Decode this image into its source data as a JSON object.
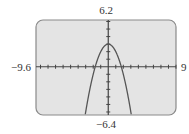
{
  "chart_data": {
    "type": "line",
    "title": "",
    "xlabel": "",
    "ylabel": "",
    "xlim": [
      -9.6,
      9
    ],
    "ylim": [
      -6.4,
      6.2
    ],
    "xscale": 1,
    "yscale": 1,
    "grid": false,
    "legend": null,
    "window_labels": {
      "xmin": "−9.6",
      "xmax": "9",
      "ymax": "6.2",
      "ymin": "−6.4"
    },
    "series": [
      {
        "name": "y = 3 − x²",
        "function": "3 - x^2",
        "vertex": [
          0,
          3
        ],
        "x_intercepts": [
          -1.73,
          1.73
        ],
        "points": [
          [
            -3.07,
            -6.4
          ],
          [
            -3,
            -6
          ],
          [
            -2.5,
            -3.25
          ],
          [
            -2,
            -1
          ],
          [
            -1.5,
            0.75
          ],
          [
            -1,
            2
          ],
          [
            -0.5,
            2.75
          ],
          [
            0,
            3
          ],
          [
            0.5,
            2.75
          ],
          [
            1,
            2
          ],
          [
            1.5,
            0.75
          ],
          [
            2,
            -1
          ],
          [
            2.5,
            -3.25
          ],
          [
            3,
            -6
          ],
          [
            3.07,
            -6.4
          ]
        ]
      }
    ]
  },
  "colors": {
    "screen_bg": "#e4e4e4",
    "frame": "#8a8a8a",
    "axes": "#444444",
    "curve": "#555555"
  }
}
